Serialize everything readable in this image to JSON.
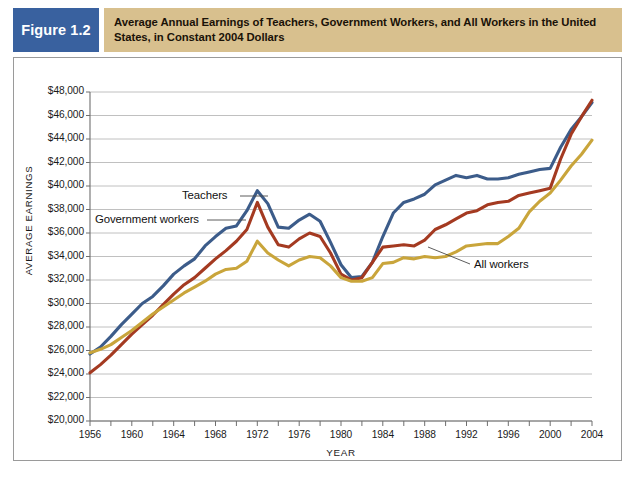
{
  "figure": {
    "badge_label": "Figure 1.2",
    "title": "Average Annual Earnings of Teachers, Government Workers, and All Workers in the United States, in Constant 2004 Dollars",
    "badge_color": "#39619f",
    "title_bar_color": "#d8c08e"
  },
  "chart_data": {
    "type": "line",
    "title": "Average Annual Earnings of Teachers, Government Workers, and All Workers in the United States, in Constant 2004 Dollars",
    "xlabel": "YEAR",
    "ylabel": "AVERAGE EARNINGS",
    "xlim": [
      1956,
      2004
    ],
    "ylim": [
      20000,
      48000
    ],
    "grid": true,
    "legend_position": "inline-annotations",
    "x_tick_labels": [
      "1956",
      "1960",
      "1964",
      "1968",
      "1972",
      "1976",
      "1980",
      "1984",
      "1988",
      "1992",
      "1996",
      "2000",
      "2004"
    ],
    "x_tick_values": [
      1956,
      1960,
      1964,
      1968,
      1972,
      1976,
      1980,
      1984,
      1988,
      1992,
      1996,
      2000,
      2004
    ],
    "x_minor_tick_values": [
      1958,
      1962,
      1966,
      1970,
      1974,
      1978,
      1982,
      1986,
      1990,
      1994,
      1998,
      2002
    ],
    "y_tick_labels": [
      "$48,000",
      "$46,000",
      "$44,000",
      "$42,000",
      "$40,000",
      "$38,000",
      "$36,000",
      "$34,000",
      "$32,000",
      "$30,000",
      "$28,000",
      "$26,000",
      "$24,000",
      "$22,000",
      "$20,000"
    ],
    "y_tick_values": [
      48000,
      46000,
      44000,
      42000,
      40000,
      38000,
      36000,
      34000,
      32000,
      30000,
      28000,
      26000,
      24000,
      22000,
      20000
    ],
    "x": [
      1956,
      1957,
      1958,
      1959,
      1960,
      1961,
      1962,
      1963,
      1964,
      1965,
      1966,
      1967,
      1968,
      1969,
      1970,
      1971,
      1972,
      1973,
      1974,
      1975,
      1976,
      1977,
      1978,
      1979,
      1980,
      1981,
      1982,
      1983,
      1984,
      1985,
      1986,
      1987,
      1988,
      1989,
      1990,
      1991,
      1992,
      1993,
      1994,
      1995,
      1996,
      1997,
      1998,
      1999,
      2000,
      2001,
      2002,
      2003,
      2004
    ],
    "series": [
      {
        "name": "Teachers",
        "color": "#3c5c8a",
        "values": [
          25700,
          26300,
          27200,
          28200,
          29100,
          30000,
          30600,
          31500,
          32500,
          33200,
          33800,
          34900,
          35700,
          36400,
          36600,
          37900,
          39600,
          38500,
          36500,
          36400,
          37100,
          37600,
          37000,
          35200,
          33300,
          32200,
          32300,
          33500,
          35700,
          37700,
          38600,
          38900,
          39300,
          40100,
          40500,
          40900,
          40700,
          40900,
          40600,
          40600,
          40700,
          41000,
          41200,
          41400,
          41500,
          43300,
          44800,
          45900,
          47100
        ],
        "annotation": "Teachers"
      },
      {
        "name": "Government workers",
        "color": "#a43a21",
        "values": [
          24100,
          24800,
          25600,
          26500,
          27400,
          28200,
          29000,
          29900,
          30800,
          31600,
          32200,
          33000,
          33800,
          34500,
          35300,
          36300,
          38600,
          36500,
          35000,
          34800,
          35500,
          36000,
          35700,
          34300,
          32500,
          32000,
          32200,
          33500,
          34800,
          34900,
          35000,
          34900,
          35400,
          36300,
          36700,
          37200,
          37700,
          37900,
          38400,
          38600,
          38700,
          39200,
          39400,
          39600,
          39800,
          42300,
          44400,
          45900,
          47300
        ],
        "annotation": "Government workers"
      },
      {
        "name": "All workers",
        "color": "#c9a53b",
        "values": [
          25800,
          26100,
          26500,
          27100,
          27700,
          28400,
          29100,
          29700,
          30300,
          30900,
          31400,
          31900,
          32500,
          32900,
          33000,
          33600,
          35300,
          34300,
          33700,
          33200,
          33700,
          34000,
          33900,
          33200,
          32200,
          31900,
          31900,
          32200,
          33400,
          33500,
          33900,
          33800,
          34000,
          33900,
          34000,
          34400,
          34900,
          35000,
          35100,
          35100,
          35700,
          36400,
          37800,
          38700,
          39400,
          40500,
          41700,
          42700,
          43900
        ],
        "annotation": "All workers"
      }
    ]
  }
}
